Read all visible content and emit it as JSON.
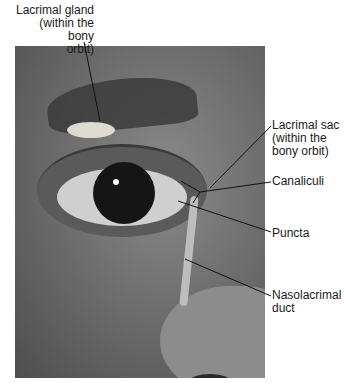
{
  "figure": {
    "photo_description": "Grayscale close-up photograph of a face showing eye, eyebrow and nose with overlaid lacrimal structures"
  },
  "labels": {
    "lacrimal_gland": {
      "line1": "Lacrimal gland",
      "line2": "(within the bony",
      "line3": "orbit)"
    },
    "lacrimal_sac": {
      "line1": "Lacrimal sac",
      "line2": "(within the",
      "line3": "bony orbit)"
    },
    "canaliculi": {
      "line1": "Canaliculi"
    },
    "puncta": {
      "line1": "Puncta"
    },
    "nasolacrimal_duct": {
      "line1": "Nasolacrimal",
      "line2": "duct"
    }
  },
  "colors": {
    "leader_line": "#111111",
    "text": "#1a1a1a",
    "background": "#ffffff"
  }
}
